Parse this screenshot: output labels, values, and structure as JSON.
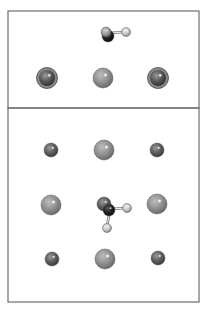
{
  "figure": {
    "panels": [
      {
        "name": "side-view",
        "frame": {
          "x": 8,
          "y": 11,
          "w": 191,
          "h": 97
        },
        "atoms": [
          {
            "type": "large",
            "cx": 47,
            "cy": 78,
            "r": 9,
            "ring": true
          },
          {
            "type": "medium",
            "cx": 103,
            "cy": 78,
            "r": 10
          },
          {
            "type": "large",
            "cx": 158,
            "cy": 78,
            "r": 9,
            "ring": true
          }
        ],
        "molecule": {
          "bonds": [
            [
              109,
              33,
              126,
              32
            ]
          ],
          "atoms": [
            {
              "type": "dark",
              "cx": 108,
              "cy": 36,
              "r": 6
            },
            {
              "type": "light-grey",
              "cx": 106,
              "cy": 32,
              "r": 5
            },
            {
              "type": "light",
              "cx": 126,
              "cy": 32,
              "r": 4.5
            }
          ]
        }
      },
      {
        "name": "top-view",
        "frame": {
          "x": 8,
          "y": 108,
          "w": 191,
          "h": 194
        },
        "atoms": [
          {
            "type": "small",
            "cx": 51,
            "cy": 150,
            "r": 7
          },
          {
            "type": "medium",
            "cx": 104,
            "cy": 150,
            "r": 10
          },
          {
            "type": "small",
            "cx": 157,
            "cy": 150,
            "r": 7
          },
          {
            "type": "medium",
            "cx": 51,
            "cy": 205,
            "r": 10
          },
          {
            "type": "medium",
            "cx": 157,
            "cy": 204,
            "r": 10
          },
          {
            "type": "small",
            "cx": 52,
            "cy": 259,
            "r": 7
          },
          {
            "type": "medium",
            "cx": 105,
            "cy": 259,
            "r": 10
          },
          {
            "type": "small",
            "cx": 158,
            "cy": 258,
            "r": 7
          }
        ],
        "molecule": {
          "bonds": [
            [
              110,
              209,
              127,
              208
            ],
            [
              110,
              209,
              107,
              227
            ]
          ],
          "atoms": [
            {
              "type": "small",
              "cx": 104,
              "cy": 204,
              "r": 7
            },
            {
              "type": "dark",
              "cx": 109,
              "cy": 210,
              "r": 6
            },
            {
              "type": "light",
              "cx": 127,
              "cy": 208,
              "r": 4.5
            },
            {
              "type": "light",
              "cx": 107,
              "cy": 228,
              "r": 4.5
            }
          ]
        }
      }
    ],
    "colors": {
      "frame": "#6e6e6e",
      "medium": "#8f8f8f",
      "small": "#5f5f5f",
      "large": "#5a5a5a",
      "dark": "#1e1e1e",
      "light": "#c4c4c4",
      "light-grey": "#9a9a9a",
      "bond": "#7a7a7a"
    }
  }
}
